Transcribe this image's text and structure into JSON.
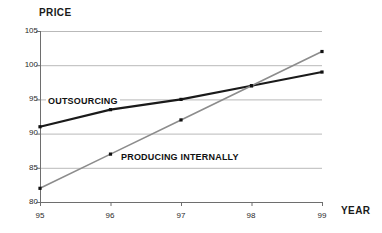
{
  "chart_data": {
    "type": "line",
    "title": "",
    "xlabel": "YEAR",
    "ylabel": "PRICE",
    "x": [
      "95",
      "96",
      "97",
      "98",
      "99"
    ],
    "categories": [
      "95",
      "96",
      "97",
      "98",
      "99"
    ],
    "xlim": [
      95,
      99
    ],
    "ylim": [
      80,
      105
    ],
    "yticks": [
      "105",
      "100",
      "95",
      "90",
      "85",
      "80"
    ],
    "ytick_values": [
      105,
      100,
      95,
      90,
      85,
      80
    ],
    "grid": true,
    "legend_position": "inline-annotations",
    "series": [
      {
        "name": "OUTSOURCING",
        "values": [
          91,
          93.5,
          95,
          97,
          99
        ],
        "color": "#1a1a1a",
        "width": 2.2,
        "markers": true
      },
      {
        "name": "PRODUCING INTERNALLY",
        "values": [
          82,
          87,
          92,
          97,
          102
        ],
        "color": "#8c8c8c",
        "width": 1.6,
        "markers": true
      }
    ],
    "annotations": [
      {
        "text": "OUTSOURCING",
        "x": 95.3,
        "y": 94.2
      },
      {
        "text": "PRODUCING INTERNALLY",
        "x": 96.2,
        "y": 86.2
      }
    ]
  },
  "axis": {
    "price_label": "PRICE",
    "year_label": "YEAR",
    "y_labels": [
      "105",
      "100",
      "95",
      "90",
      "85",
      "80"
    ],
    "x_labels": [
      "95",
      "96",
      "97",
      "98",
      "99"
    ]
  },
  "colors": {
    "outsourcing": "#1a1a1a",
    "producing_internally": "#8c8c8c",
    "grid": "#b9b9b9",
    "axis": "#6e6e6e",
    "background": "#ffffff",
    "text": "#1a1a1a"
  }
}
